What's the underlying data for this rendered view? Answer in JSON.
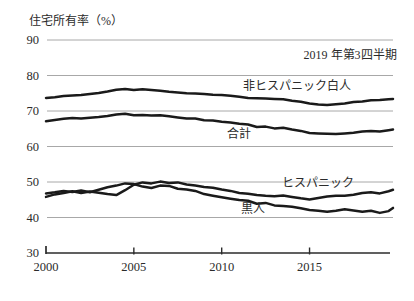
{
  "chart_data": {
    "type": "line",
    "title": "",
    "ylabel": "住宅所有率（%）",
    "annotation": {
      "text": "2019 年第3四半期",
      "x": 2019.95,
      "y": 85.8,
      "align": "end"
    },
    "xlim": [
      2000,
      2019.75
    ],
    "ylim": [
      30,
      90
    ],
    "x_ticks": [
      2000,
      2005,
      2010,
      2015
    ],
    "y_ticks": [
      30,
      40,
      50,
      60,
      70,
      80,
      90
    ],
    "grid": "horizontal",
    "legend_position": "inline-labels",
    "colors": {
      "line": "#1a1a1a",
      "grid": "#a8a8a8",
      "axis": "#2b2b2b",
      "text": "#2b2b2b",
      "background": "#ffffff"
    },
    "x": [
      2000,
      2000.5,
      2001,
      2001.5,
      2002,
      2002.5,
      2003,
      2003.5,
      2004,
      2004.5,
      2005,
      2005.5,
      2006,
      2006.5,
      2007,
      2007.5,
      2008,
      2008.5,
      2009,
      2009.5,
      2010,
      2010.5,
      2011,
      2011.5,
      2012,
      2012.5,
      2013,
      2013.5,
      2014,
      2014.5,
      2015,
      2015.5,
      2016,
      2016.5,
      2017,
      2017.5,
      2018,
      2018.5,
      2019,
      2019.5,
      2019.75
    ],
    "series": [
      {
        "name": "非ヒスパニック白人",
        "label_anchor": {
          "x": 2014.3,
          "y": 77.0
        },
        "values": [
          73.7,
          73.9,
          74.2,
          74.4,
          74.5,
          74.8,
          75.1,
          75.5,
          76.0,
          76.2,
          75.9,
          76.1,
          75.9,
          75.7,
          75.4,
          75.2,
          75.0,
          74.9,
          74.8,
          74.6,
          74.5,
          74.3,
          74.0,
          73.7,
          73.6,
          73.5,
          73.4,
          73.3,
          72.9,
          72.6,
          72.1,
          71.8,
          71.7,
          71.9,
          72.1,
          72.5,
          72.7,
          73.0,
          73.1,
          73.3,
          73.4
        ]
      },
      {
        "name": "合計",
        "label_anchor": {
          "x": 2011.0,
          "y": 63.5
        },
        "values": [
          67.1,
          67.5,
          67.8,
          68.0,
          67.9,
          68.1,
          68.3,
          68.6,
          69.0,
          69.2,
          68.8,
          68.9,
          68.7,
          68.8,
          68.5,
          68.2,
          67.9,
          67.9,
          67.4,
          67.3,
          67.0,
          66.8,
          66.4,
          66.2,
          65.5,
          65.6,
          65.1,
          65.3,
          64.8,
          64.4,
          63.8,
          63.7,
          63.6,
          63.5,
          63.7,
          63.9,
          64.2,
          64.4,
          64.2,
          64.6,
          64.8
        ]
      },
      {
        "name": "ヒスパニック",
        "label_anchor": {
          "x": 2015.5,
          "y": 49.8
        },
        "values": [
          45.8,
          46.5,
          46.9,
          47.4,
          46.9,
          47.3,
          47.0,
          46.6,
          46.3,
          47.7,
          49.2,
          49.9,
          49.6,
          50.1,
          49.7,
          49.9,
          49.3,
          49.0,
          48.6,
          48.4,
          47.9,
          47.5,
          46.9,
          46.7,
          46.3,
          46.1,
          46.0,
          46.2,
          45.8,
          45.4,
          45.1,
          45.5,
          45.9,
          46.1,
          46.1,
          46.4,
          46.9,
          47.1,
          46.8,
          47.4,
          47.8
        ]
      },
      {
        "name": "黒人",
        "label_anchor": {
          "x": 2011.8,
          "y": 42.5
        },
        "values": [
          46.8,
          47.1,
          47.5,
          47.2,
          47.6,
          47.1,
          47.8,
          48.5,
          49.0,
          49.6,
          49.4,
          48.7,
          48.3,
          49.0,
          48.9,
          48.1,
          47.9,
          47.5,
          46.6,
          46.1,
          45.7,
          45.3,
          44.9,
          44.7,
          43.9,
          44.1,
          43.4,
          43.2,
          43.0,
          42.6,
          42.1,
          41.9,
          41.6,
          41.9,
          42.3,
          42.0,
          41.6,
          41.9,
          41.3,
          41.8,
          42.7
        ]
      }
    ]
  }
}
